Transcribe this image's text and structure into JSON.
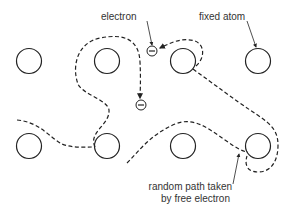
{
  "diagram": {
    "type": "free electron random path among fixed atoms",
    "labels": {
      "electron": "electron",
      "fixed_atom": "fixed atom",
      "path_line1": "random path taken",
      "path_line2": "by free electron"
    },
    "atoms": [
      {
        "row": 1,
        "col": 1,
        "cx": 29,
        "cy": 61
      },
      {
        "row": 1,
        "col": 2,
        "cx": 107,
        "cy": 61
      },
      {
        "row": 1,
        "col": 3,
        "cx": 183,
        "cy": 61
      },
      {
        "row": 1,
        "col": 4,
        "cx": 258,
        "cy": 61
      },
      {
        "row": 2,
        "col": 1,
        "cx": 29,
        "cy": 146
      },
      {
        "row": 2,
        "col": 2,
        "cx": 107,
        "cy": 146
      },
      {
        "row": 2,
        "col": 3,
        "cx": 183,
        "cy": 146
      },
      {
        "row": 2,
        "col": 4,
        "cx": 258,
        "cy": 146
      }
    ],
    "electrons": [
      {
        "cx": 152,
        "cy": 51
      },
      {
        "cx": 141,
        "cy": 105
      }
    ],
    "colors": {
      "stroke": "#222222",
      "text": "#333333",
      "background": "#ffffff"
    }
  }
}
